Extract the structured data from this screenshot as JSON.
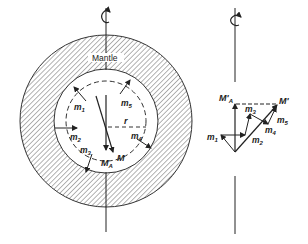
{
  "figure": {
    "left_panel": {
      "label_mantle": "Mantle",
      "label_radius": "r",
      "moments": [
        "m1",
        "m2",
        "m3",
        "m4",
        "m5"
      ],
      "resultant_label": "M",
      "axial_label": "MA"
    },
    "right_panel": {
      "resultant_label": "M'",
      "axial_label": "M'A",
      "moments": [
        "m1",
        "m2",
        "m3",
        "m4",
        "m5"
      ]
    },
    "colors": {
      "ink": "#222222",
      "background": "#ffffff",
      "hatch": "#555555"
    }
  }
}
